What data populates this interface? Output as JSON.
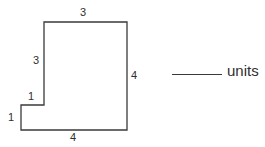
{
  "figure": {
    "name": "step-polygon",
    "stroke_color": "#3a3a3a",
    "fill_color": "#ffffff",
    "stroke_width": 1.3,
    "vertices": [
      [
        44,
        22
      ],
      [
        127,
        22
      ],
      [
        127,
        130
      ],
      [
        21,
        130
      ],
      [
        21,
        105
      ],
      [
        44,
        105
      ]
    ],
    "side_labels": {
      "top": "3",
      "upper_left": "3",
      "right": "4",
      "bottom": "4",
      "step_horizontal": "1",
      "lower_left": "1"
    }
  },
  "answer": {
    "blank_line": "",
    "units_label": "units"
  },
  "chart_data": {
    "type": "diagram",
    "title": "",
    "shape": "L-shaped step polygon",
    "labeled_sides": [
      {
        "side": "top",
        "length": 3,
        "orientation": "horizontal"
      },
      {
        "side": "upper-left",
        "length": 3,
        "orientation": "vertical"
      },
      {
        "side": "right",
        "length": 4,
        "orientation": "vertical"
      },
      {
        "side": "bottom",
        "length": 4,
        "orientation": "horizontal"
      },
      {
        "side": "step-horizontal",
        "length": 1,
        "orientation": "horizontal"
      },
      {
        "side": "lower-left",
        "length": 1,
        "orientation": "vertical"
      }
    ],
    "units": "units"
  }
}
